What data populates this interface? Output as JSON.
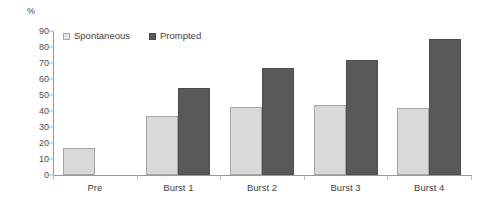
{
  "chart_data": {
    "type": "bar",
    "title": "",
    "subtitle": "",
    "xlabel": "",
    "ylabel": "%",
    "ylim": [
      0,
      90
    ],
    "ytick_step": 10,
    "yticks": [
      0,
      10,
      20,
      30,
      40,
      50,
      60,
      70,
      80,
      90
    ],
    "ytick_labels": [
      "0",
      "10",
      "20",
      "30",
      "40",
      "50",
      "60",
      "70",
      "80",
      "90"
    ],
    "grid": false,
    "legend_position": "top-left",
    "categories": [
      "Pre",
      "Burst 1",
      "Burst 2",
      "Burst 3",
      "Burst 4"
    ],
    "series": [
      {
        "name": "Spontaneous",
        "color": "#d9d9d9",
        "border_color": "#a6a6a6",
        "values": [
          17,
          37,
          42.5,
          43.5,
          42
        ]
      },
      {
        "name": "Prompted",
        "color": "#595959",
        "border_color": "#4d4d4d",
        "values": [
          null,
          54.5,
          67,
          72,
          85
        ]
      }
    ]
  },
  "legend": {
    "items": [
      {
        "label": "Spontaneous",
        "swatch": "legend-swatch-spontaneous"
      },
      {
        "label": "Prompted",
        "swatch": "legend-swatch-prompted"
      }
    ]
  },
  "axis": {
    "y_unit_label": "%"
  }
}
